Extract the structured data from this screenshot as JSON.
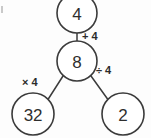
{
  "diagram": {
    "type": "number-bond",
    "background_color": "#fdfdfd",
    "stroke_color": "#3b3b3b",
    "text_color": "#2e2e2e",
    "nodes": {
      "top": {
        "value": "4",
        "cx": 77,
        "cy": 13,
        "r": 20
      },
      "center": {
        "value": "8",
        "cx": 77,
        "cy": 61,
        "r": 20
      },
      "bottom_left": {
        "value": "32",
        "cx": 33,
        "cy": 114,
        "r": 21
      },
      "bottom_right": {
        "value": "2",
        "cx": 123,
        "cy": 114,
        "r": 21
      }
    },
    "edges": {
      "top_to_center": {
        "label": "+ 4",
        "label_x": 82,
        "label_y": 36
      },
      "center_to_bottom_left": {
        "label": "× 4",
        "label_x": 31,
        "label_y": 82
      },
      "center_to_bottom_right": {
        "label": "÷ 4",
        "label_x": 100,
        "label_y": 70
      }
    }
  }
}
